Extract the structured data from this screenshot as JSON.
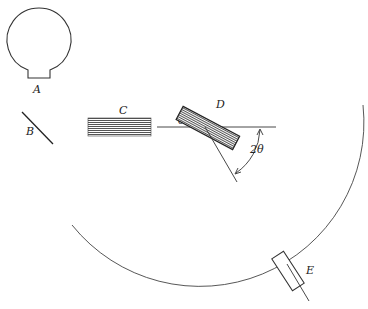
{
  "labels": {
    "A": "A",
    "B": "B",
    "C": "C",
    "D": "D",
    "E": "E",
    "theta": "θ",
    "two_theta": "2θ"
  },
  "components": [
    {
      "id": "A",
      "name": "x-ray tube"
    },
    {
      "id": "B",
      "name": "filter"
    },
    {
      "id": "C",
      "name": "collimator slits"
    },
    {
      "id": "D",
      "name": "crystal"
    },
    {
      "id": "E",
      "name": "detector"
    }
  ],
  "colors": {
    "line": "#333333",
    "hatch": "#555555"
  }
}
